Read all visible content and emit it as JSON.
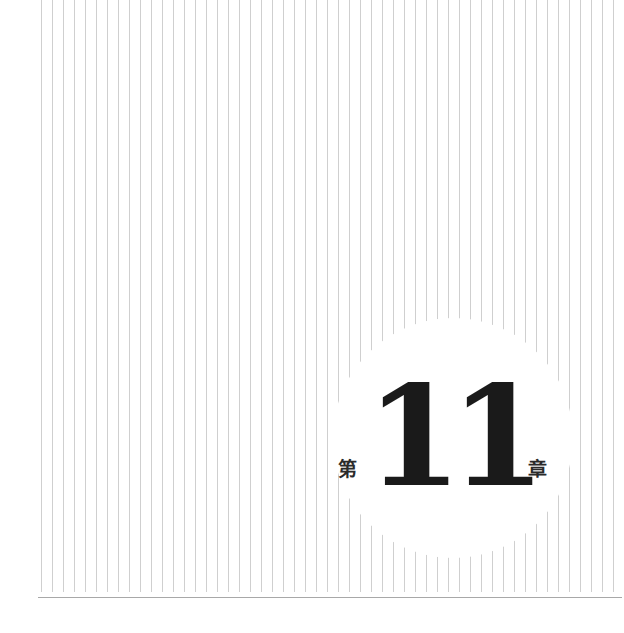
{
  "chapter": {
    "prefix": "第",
    "digits": [
      "1",
      "1"
    ],
    "suffix": "章",
    "number": 11
  },
  "decoration": {
    "line_color": "#cfcfcf",
    "line_spacing_px": 11,
    "line_start_x": 41,
    "line_count": 53,
    "rule_color": "#a8a8a8",
    "text_color": "#1a1a1a"
  }
}
